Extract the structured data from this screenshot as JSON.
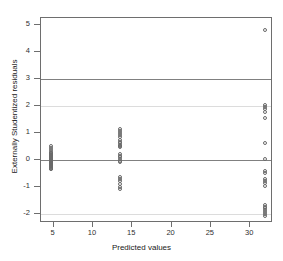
{
  "chart_data": {
    "type": "scatter",
    "title": "",
    "xlabel": "Predicted values",
    "ylabel": "Externally Studentized residuals",
    "xlim": [
      3.4,
      32.9
    ],
    "ylim": [
      -2.35,
      5.25
    ],
    "xticks": [
      5,
      10,
      15,
      20,
      25,
      30
    ],
    "yticks": [
      -2,
      -1,
      0,
      1,
      2,
      3,
      4,
      5
    ],
    "grid": false,
    "legend": null,
    "reference_lines": [
      {
        "y": 3,
        "style": "solid",
        "color": "#808080",
        "weight": "strong"
      },
      {
        "y": 2,
        "style": "solid",
        "color": "#dcdcdc",
        "weight": "faint"
      },
      {
        "y": 0,
        "style": "solid",
        "color": "#808080",
        "weight": "strong"
      },
      {
        "y": -2,
        "style": "solid",
        "color": "#dcdcdc",
        "weight": "faint"
      }
    ],
    "marker": "open-circle",
    "marker_color": "#6a6a6a",
    "series": [
      {
        "name": "residuals",
        "x": [
          4.7,
          4.7,
          4.7,
          4.7,
          4.7,
          4.7,
          4.7,
          4.7,
          4.7,
          4.7,
          4.7,
          4.7,
          4.7,
          4.7,
          4.7,
          4.7,
          4.7,
          4.7,
          4.7,
          4.7,
          4.7,
          4.7,
          4.7,
          4.7,
          4.7,
          13.5,
          13.5,
          13.5,
          13.5,
          13.5,
          13.5,
          13.5,
          13.5,
          13.5,
          13.5,
          13.5,
          13.5,
          13.5,
          13.5,
          13.5,
          13.5,
          13.5,
          13.5,
          13.5,
          13.5,
          13.5,
          13.5,
          13.5,
          31.9,
          31.9,
          31.9,
          31.9,
          31.9,
          31.9,
          31.9,
          31.9,
          31.9,
          31.9,
          31.9,
          31.9,
          31.9,
          31.9,
          31.9,
          31.9,
          31.9,
          31.9,
          31.9,
          31.9,
          31.9
        ],
        "y": [
          0.5,
          0.42,
          0.36,
          0.3,
          0.25,
          0.2,
          0.16,
          0.12,
          0.09,
          0.06,
          0.03,
          0.0,
          0.0,
          -0.03,
          -0.06,
          -0.09,
          -0.12,
          -0.15,
          -0.18,
          -0.21,
          -0.24,
          -0.27,
          -0.3,
          -0.33,
          -0.36,
          1.12,
          1.06,
          0.98,
          0.9,
          0.82,
          0.74,
          0.66,
          0.6,
          0.54,
          0.5,
          0.46,
          0.2,
          0.14,
          0.08,
          0.02,
          -0.04,
          -0.1,
          -0.66,
          -0.72,
          -0.8,
          -0.92,
          -1.0,
          -1.08,
          4.82,
          2.02,
          1.94,
          1.86,
          1.78,
          1.54,
          0.62,
          0.04,
          -0.42,
          -0.48,
          -0.72,
          -0.8,
          -0.88,
          -0.96,
          -1.68,
          -1.74,
          -1.8,
          -1.86,
          -1.94,
          -2.02,
          -2.08
        ]
      }
    ]
  }
}
